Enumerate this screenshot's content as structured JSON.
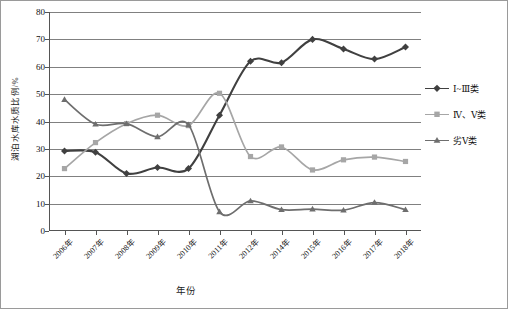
{
  "figure": {
    "background_color": "#ffffff",
    "border_color": "#9a9a9a"
  },
  "chart_data": {
    "type": "line",
    "title": "",
    "xlabel": "年份",
    "ylabel": "湖泊水库水质比例/%",
    "categories": [
      "2006年",
      "2007年",
      "2008年",
      "2009年",
      "2010年",
      "2011年",
      "2012年",
      "2014年",
      "2015年",
      "2016年",
      "2017年",
      "2018年"
    ],
    "ylim": [
      0,
      80
    ],
    "yticks": [
      0,
      10,
      20,
      30,
      40,
      50,
      60,
      70,
      80
    ],
    "grid": "horizontal",
    "legend_position": "right",
    "series": [
      {
        "name": "Ⅰ~Ⅲ类",
        "color": "#404040",
        "marker": "diamond",
        "values": [
          29.2,
          28.8,
          21.0,
          23.2,
          22.8,
          42.3,
          62.0,
          61.5,
          70.0,
          66.5,
          62.8,
          67.2
        ]
      },
      {
        "name": "Ⅳ、Ⅴ类",
        "color": "#a6a6a6",
        "marker": "square",
        "values": [
          22.8,
          32.3,
          39.2,
          42.3,
          38.5,
          50.3,
          27.2,
          30.7,
          22.3,
          26.0,
          27.0,
          25.4
        ]
      },
      {
        "name": "劣Ⅴ类",
        "color": "#6e6e6e",
        "marker": "triangle",
        "values": [
          48.0,
          39.0,
          39.2,
          34.4,
          38.8,
          7.0,
          11.0,
          7.8,
          8.0,
          7.6,
          10.4,
          7.8
        ]
      }
    ]
  },
  "legend": {
    "items": [
      {
        "label": "Ⅰ~Ⅲ类",
        "color": "#404040",
        "marker": "diamond"
      },
      {
        "label": "Ⅳ、Ⅴ类",
        "color": "#a6a6a6",
        "marker": "square"
      },
      {
        "label": "劣Ⅴ类",
        "color": "#6e6e6e",
        "marker": "triangle"
      }
    ]
  }
}
